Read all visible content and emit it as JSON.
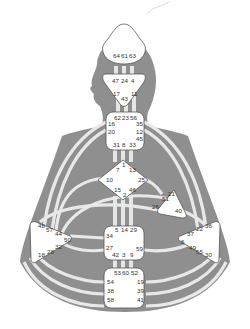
{
  "diagram": {
    "type": "human-design-bodygraph",
    "colors": {
      "body_fill": "#8f8f8f",
      "channel_fill": "#e6e6e6",
      "center_fill": "#ffffff",
      "center_stroke": "#555555",
      "text": "#333333"
    },
    "centers": {
      "head": {
        "gates": [
          "64",
          "61",
          "63"
        ]
      },
      "ajna": {
        "gates": [
          "47",
          "24",
          "4",
          "17",
          "11",
          "43"
        ]
      },
      "throat": {
        "gates": [
          "62",
          "23",
          "56",
          "16",
          "35",
          "20",
          "12",
          "45",
          "31",
          "8",
          "33"
        ]
      },
      "g": {
        "gates": [
          "1",
          "7",
          "13",
          "10",
          "25",
          "15",
          "2",
          "46"
        ]
      },
      "heart": {
        "gates": [
          "21",
          "51",
          "26",
          "40"
        ]
      },
      "spleen": {
        "gates": [
          "48",
          "57",
          "44",
          "50",
          "32",
          "28",
          "18"
        ]
      },
      "sacral": {
        "gates": [
          "5",
          "14",
          "29",
          "34",
          "27",
          "59",
          "42",
          "3",
          "9"
        ]
      },
      "solar_plexus": {
        "gates": [
          "36",
          "22",
          "37",
          "6",
          "49",
          "55",
          "30"
        ]
      },
      "root": {
        "gates": [
          "53",
          "60",
          "52",
          "54",
          "19",
          "38",
          "39",
          "58",
          "41"
        ]
      }
    }
  }
}
